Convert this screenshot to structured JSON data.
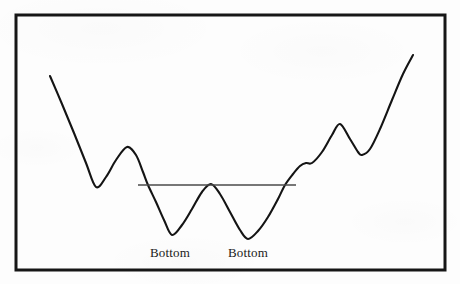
{
  "figure": {
    "background_color": "#fdfdfd",
    "frame": {
      "name": "chart-border-frame",
      "x": 16,
      "y": 15,
      "width": 429,
      "height": 255,
      "stroke_color": "#161616",
      "stroke_width": 3
    }
  },
  "chart_data": {
    "type": "line",
    "title": "",
    "subtitle": "",
    "xlabel": "",
    "ylabel": "",
    "pattern_name": "Double Bottom",
    "grid": false,
    "legend": null,
    "axis_ticks_visible": false,
    "xlim": [
      16,
      445
    ],
    "ylim": [
      270,
      15
    ],
    "series": [
      {
        "name": "price",
        "stroke_color": "#141414",
        "stroke_width": 2.1,
        "x": [
          50,
          62,
          74,
          86,
          96,
          106,
          116,
          127,
          136,
          143,
          148,
          156,
          164,
          172,
          182,
          192,
          202,
          211,
          220,
          230,
          240,
          248,
          258,
          268,
          278,
          285,
          293,
          300,
          306,
          312,
          322,
          332,
          340,
          350,
          358,
          362,
          370,
          380,
          392,
          403,
          413
        ],
        "y": [
          76,
          104,
          133,
          163,
          187,
          177,
          160,
          147,
          155,
          172,
          185,
          202,
          220,
          235,
          225,
          209,
          192,
          184,
          194,
          212,
          230,
          239,
          231,
          217,
          199,
          185,
          174,
          166,
          163,
          163,
          152,
          135,
          124,
          139,
          152,
          155,
          149,
          129,
          100,
          74,
          55
        ]
      }
    ],
    "annotations": [
      {
        "name": "neckline",
        "type": "hline",
        "label": "",
        "x_start": 138,
        "x_end": 296,
        "y": 185,
        "stroke_color": "#4a4a4a",
        "stroke_width": 1.3
      },
      {
        "name": "bottom-label-1",
        "type": "text",
        "text": "Bottom",
        "x": 170,
        "y": 257,
        "anchor": "middle"
      },
      {
        "name": "bottom-label-2",
        "type": "text",
        "text": "Bottom",
        "x": 248,
        "y": 257,
        "anchor": "middle"
      }
    ],
    "key_points": [
      {
        "label": "start",
        "x": 50,
        "y": 76
      },
      {
        "label": "trough-1",
        "x": 96,
        "y": 187
      },
      {
        "label": "peak-1",
        "x": 127,
        "y": 147
      },
      {
        "label": "bottom-1",
        "x": 172,
        "y": 235
      },
      {
        "label": "middle-peak",
        "x": 211,
        "y": 184
      },
      {
        "label": "bottom-2",
        "x": 248,
        "y": 239
      },
      {
        "label": "breakout",
        "x": 285,
        "y": 185
      },
      {
        "label": "ledge",
        "x": 306,
        "y": 163
      },
      {
        "label": "peak-2",
        "x": 340,
        "y": 124
      },
      {
        "label": "pullback",
        "x": 362,
        "y": 155
      },
      {
        "label": "end",
        "x": 413,
        "y": 55
      }
    ]
  }
}
